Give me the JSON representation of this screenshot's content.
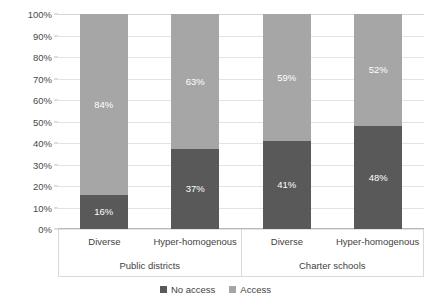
{
  "chart_data": {
    "type": "bar",
    "subtype": "stacked-100-percent",
    "title": "",
    "xlabel": "",
    "ylabel": "",
    "ylim": [
      0,
      100
    ],
    "ytick_labels": [
      "0%",
      "10%",
      "20%",
      "30%",
      "40%",
      "50%",
      "60%",
      "70%",
      "80%",
      "90%",
      "100%"
    ],
    "ytick_values": [
      0,
      10,
      20,
      30,
      40,
      50,
      60,
      70,
      80,
      90,
      100
    ],
    "grid": true,
    "legend_position": "bottom-center",
    "categories": [
      "Diverse",
      "Hyper-homogenous",
      "Diverse",
      "Hyper-homogenous"
    ],
    "groups": [
      {
        "label": "Public districts",
        "categories": [
          "Diverse",
          "Hyper-homogenous"
        ]
      },
      {
        "label": "Charter schools",
        "categories": [
          "Diverse",
          "Hyper-homogenous"
        ]
      }
    ],
    "series": [
      {
        "name": "No access",
        "color": "#595959",
        "values": [
          16,
          37,
          41,
          48
        ],
        "data_labels": [
          "16%",
          "37%",
          "41%",
          "48%"
        ]
      },
      {
        "name": "Access",
        "color": "#a6a6a6",
        "values": [
          84,
          63,
          59,
          52
        ],
        "data_labels": [
          "84%",
          "63%",
          "59%",
          "52%"
        ]
      }
    ]
  },
  "legend": {
    "items": [
      {
        "label": "No access",
        "color": "#595959"
      },
      {
        "label": "Access",
        "color": "#a6a6a6"
      }
    ]
  }
}
